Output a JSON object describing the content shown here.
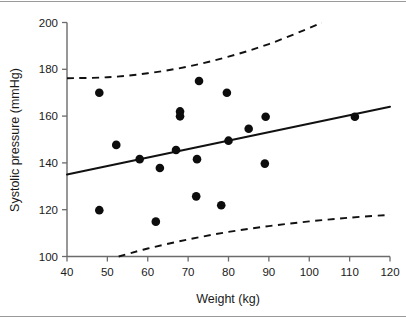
{
  "chart_data": {
    "type": "scatter",
    "title": "",
    "xlabel": "Weight (kg)",
    "ylabel": "Systolic pressure (mmHg)",
    "xlim": [
      40,
      120
    ],
    "ylim": [
      100,
      200
    ],
    "xticks": [
      40,
      50,
      60,
      70,
      80,
      90,
      100,
      110,
      120
    ],
    "yticks": [
      100,
      120,
      140,
      160,
      180,
      200
    ],
    "xtick_labels": [
      "40",
      "50",
      "60",
      "70",
      "80",
      "90",
      "100",
      "110",
      "120"
    ],
    "ytick_labels": [
      "100",
      "120",
      "140",
      "160",
      "180",
      "200"
    ],
    "grid": false,
    "legend": false,
    "series": [
      {
        "name": "observations",
        "type": "scatter",
        "marker": "filled-circle",
        "color": "#0d0d0d",
        "points": [
          {
            "x": 48.0,
            "y": 170.0
          },
          {
            "x": 48.0,
            "y": 119.8
          },
          {
            "x": 52.2,
            "y": 147.7
          },
          {
            "x": 58.0,
            "y": 141.6
          },
          {
            "x": 62.0,
            "y": 114.9
          },
          {
            "x": 63.0,
            "y": 137.8
          },
          {
            "x": 67.0,
            "y": 145.5
          },
          {
            "x": 68.0,
            "y": 159.9
          },
          {
            "x": 68.0,
            "y": 162.0
          },
          {
            "x": 72.0,
            "y": 125.7
          },
          {
            "x": 72.2,
            "y": 141.6
          },
          {
            "x": 72.7,
            "y": 175.0
          },
          {
            "x": 78.2,
            "y": 121.9
          },
          {
            "x": 79.6,
            "y": 170.0
          },
          {
            "x": 80.0,
            "y": 149.5
          },
          {
            "x": 85.0,
            "y": 154.6
          },
          {
            "x": 89.0,
            "y": 139.7
          },
          {
            "x": 89.2,
            "y": 159.7
          },
          {
            "x": 111.3,
            "y": 159.7
          }
        ]
      },
      {
        "name": "regression-line",
        "type": "line",
        "style": "solid",
        "color": "#111111",
        "x": [
          40,
          120
        ],
        "y": [
          135.0,
          164.0
        ]
      },
      {
        "name": "upper-prediction-limit",
        "type": "line",
        "style": "dashed",
        "color": "#111111",
        "x": [
          40,
          50,
          60,
          70,
          80,
          90,
          100,
          103
        ],
        "y": [
          176.2,
          176.6,
          178.3,
          181.2,
          185.4,
          190.8,
          197.6,
          200.0
        ]
      },
      {
        "name": "lower-prediction-limit",
        "type": "line",
        "style": "dashed",
        "color": "#111111",
        "x": [
          52.8,
          60,
          70,
          80,
          90,
          100,
          110,
          120
        ],
        "y": [
          100.0,
          103.4,
          107.3,
          110.5,
          113.0,
          115.0,
          116.6,
          117.8
        ]
      }
    ]
  }
}
